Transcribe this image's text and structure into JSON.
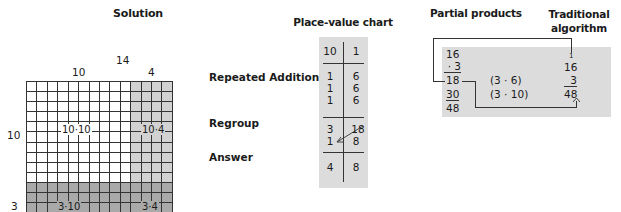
{
  "headers": {
    "solution": "Solution",
    "place_value": "Place-value chart",
    "partial_products": "Partial products",
    "traditional": "Traditional algorithm"
  },
  "area_model": {
    "top_total": "14",
    "top_tens": "10",
    "top_ones": "4",
    "left_tens": "10",
    "left_ones": "3",
    "columns": 14,
    "rows": 13,
    "cells": {
      "tl": "10·10",
      "tr": "10·4",
      "bl": "3·10",
      "br": "3·4"
    },
    "colors": {
      "white": "#ffffff",
      "light": "#d2d2d2",
      "dark": "#a9a9a9"
    }
  },
  "row_labels": {
    "repeated_addition": "Repeated Addition",
    "regroup": "Regroup",
    "answer": "Answer"
  },
  "place_value_chart": {
    "head": {
      "tens": "10",
      "ones": "1"
    },
    "repeated": [
      {
        "tens": "1",
        "ones": "6"
      },
      {
        "tens": "1",
        "ones": "6"
      },
      {
        "tens": "1",
        "ones": "6"
      }
    ],
    "regroup_before": {
      "tens": "3",
      "ones": "18"
    },
    "regroup_after": {
      "tens": "1",
      "ones": "8"
    },
    "answer": {
      "tens": "4",
      "ones": "8"
    }
  },
  "partial_products": {
    "multiplicand": "16",
    "multiplier": "· 3",
    "pp1": "18",
    "pp1_note": "(3 · 6)",
    "pp2": "30",
    "pp2_note": "(3 · 10)",
    "total": "48"
  },
  "traditional_algorithm": {
    "carry": "1",
    "multiplicand": "16",
    "multiplier": "3",
    "result": "48"
  }
}
